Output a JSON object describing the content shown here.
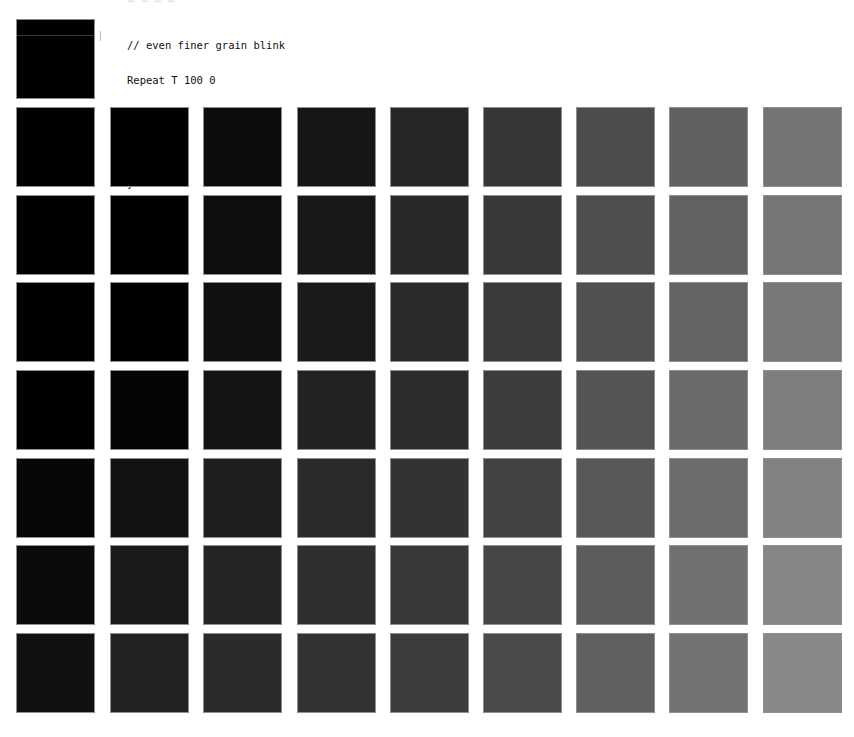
{
  "top_partial_text": "… … … …",
  "code": {
    "lines": [
      "// even finer grain blink",
      "Repeat T 100 0",
      "{",
      "Paper T",
      "}"
    ]
  },
  "header_swatch": {
    "color": "#000000"
  },
  "grid": {
    "columns": 9,
    "rows": 7,
    "col_x": [
      16,
      110,
      203,
      297,
      390,
      483,
      576,
      669,
      763
    ],
    "row_y": [
      107,
      195,
      282,
      370,
      458,
      545,
      633
    ],
    "colors": [
      [
        "#000000",
        "#000000",
        "#0c0c0c",
        "#161616",
        "#262626",
        "#363636",
        "#4c4c4c",
        "#606060",
        "#747474"
      ],
      [
        "#000000",
        "#000000",
        "#0e0e0e",
        "#181818",
        "#282828",
        "#383838",
        "#4e4e4e",
        "#626262",
        "#767676"
      ],
      [
        "#000000",
        "#000000",
        "#101010",
        "#1a1a1a",
        "#2a2a2a",
        "#3a3a3a",
        "#505050",
        "#646464",
        "#787878"
      ],
      [
        "#000000",
        "#050505",
        "#141414",
        "#222222",
        "#2c2c2c",
        "#3c3c3c",
        "#545454",
        "#6a6a6a",
        "#7e7e7e"
      ],
      [
        "#060606",
        "#121212",
        "#1e1e1e",
        "#2a2a2a",
        "#333333",
        "#424242",
        "#585858",
        "#6c6c6c",
        "#828282"
      ],
      [
        "#0b0b0b",
        "#1a1a1a",
        "#242424",
        "#2f2f2f",
        "#383838",
        "#464646",
        "#5c5c5c",
        "#707070",
        "#858585"
      ],
      [
        "#111111",
        "#222222",
        "#2a2a2a",
        "#333333",
        "#3c3c3c",
        "#4a4a4a",
        "#606060",
        "#737373",
        "#888888"
      ]
    ]
  }
}
